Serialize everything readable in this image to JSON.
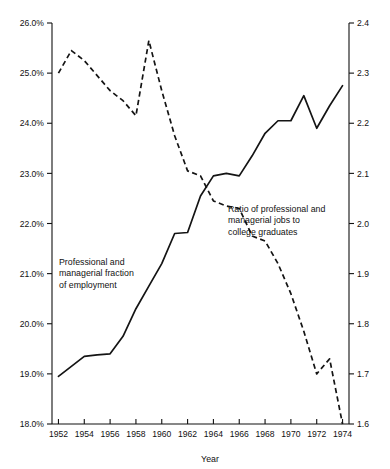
{
  "chart_data": {
    "type": "line",
    "title": "",
    "xlabel": "Year",
    "ylabel": "",
    "grid": false,
    "legend_position": "inline-annotations",
    "x": [
      1952,
      1953,
      1954,
      1955,
      1956,
      1957,
      1958,
      1959,
      1960,
      1961,
      1962,
      1963,
      1964,
      1965,
      1966,
      1967,
      1968,
      1969,
      1970,
      1971,
      1972,
      1973,
      1974
    ],
    "xlim": [
      1951.5,
      1974.5
    ],
    "xticks": [
      "1952",
      "1954",
      "1956",
      "1958",
      "1960",
      "1962",
      "1964",
      "1966",
      "1968",
      "1970",
      "1972",
      "1974"
    ],
    "xtick_values": [
      1952,
      1954,
      1956,
      1958,
      1960,
      1962,
      1964,
      1966,
      1968,
      1970,
      1972,
      1974
    ],
    "axes": [
      {
        "id": "left",
        "label": "Professional and managerial fraction of employment",
        "ylim": [
          18.0,
          26.0
        ],
        "yticks": [
          "18.0%",
          "19.0%",
          "20.0%",
          "21.0%",
          "22.0%",
          "23.0%",
          "24.0%",
          "25.0%",
          "26.0%"
        ],
        "ytick_values": [
          18.0,
          19.0,
          20.0,
          21.0,
          22.0,
          23.0,
          24.0,
          25.0,
          26.0
        ]
      },
      {
        "id": "right",
        "label": "Ratio of professional and managerial jobs to college graduates",
        "ylim": [
          1.6,
          2.4
        ],
        "yticks": [
          "1.6",
          "1.7",
          "1.8",
          "1.9",
          "2.0",
          "2.1",
          "2.2",
          "2.3",
          "2.4"
        ],
        "ytick_values": [
          1.6,
          1.7,
          1.8,
          1.9,
          2.0,
          2.1,
          2.2,
          2.3,
          2.4
        ]
      }
    ],
    "series": [
      {
        "name": "Professional and managerial fraction of employment",
        "axis": "left",
        "style": "solid",
        "units": "percent",
        "values": [
          18.95,
          19.15,
          19.35,
          19.38,
          19.4,
          19.75,
          20.3,
          20.75,
          21.2,
          21.8,
          21.82,
          22.55,
          22.95,
          23.0,
          22.95,
          23.35,
          23.8,
          24.05,
          24.05,
          24.55,
          23.9,
          24.35,
          24.75
        ]
      },
      {
        "name": "Ratio of professional and managerial jobs to college graduates",
        "axis": "right",
        "style": "dashed",
        "units": "ratio",
        "values": [
          2.3,
          2.345,
          2.325,
          2.295,
          2.265,
          2.245,
          2.215,
          2.365,
          2.265,
          2.175,
          2.105,
          2.095,
          2.045,
          2.035,
          2.03,
          1.975,
          1.965,
          1.92,
          1.86,
          1.785,
          1.7,
          1.73,
          1.6
        ]
      }
    ],
    "annotations": [
      {
        "id": "annot-left",
        "lines": [
          "Professional and",
          "managerial fraction",
          "of employment"
        ],
        "x": 59,
        "y": 265
      },
      {
        "id": "annot-right",
        "lines": [
          "Ratio of professional and",
          "managerial jobs to",
          "college graduates"
        ],
        "x": 228,
        "y": 212
      }
    ]
  },
  "colors": {
    "axis": "#111111",
    "series": "#141414",
    "background": "#ffffff"
  }
}
